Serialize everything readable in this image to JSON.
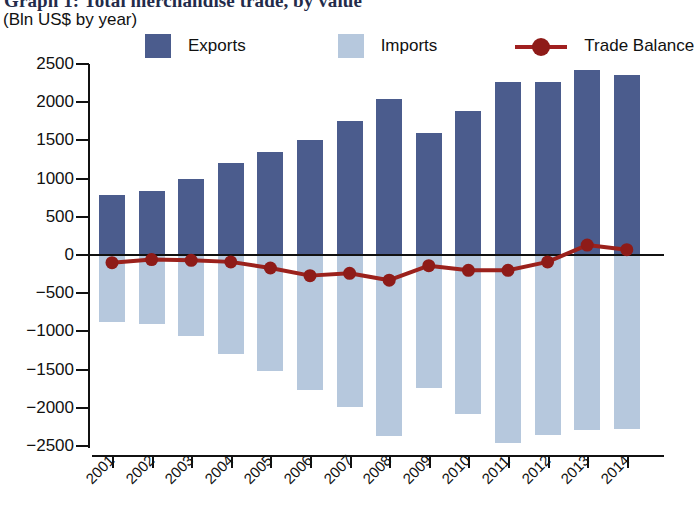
{
  "header": {
    "title": "Graph 1: Total merchandise trade, by value",
    "subtitle": "(Bln US$ by year)"
  },
  "legend": {
    "items": [
      {
        "label": "Exports",
        "color": "#4b5c8d",
        "marker": "square"
      },
      {
        "label": "Imports",
        "color": "#b6c8dd",
        "marker": "square"
      },
      {
        "label": "Trade Balance",
        "color": "#8e1b18",
        "marker": "line-dot"
      }
    ]
  },
  "chart_data": {
    "type": "bar",
    "title": "Graph 1: Total merchandise trade, by value",
    "subtitle": "(Bln US$ by year)",
    "xlabel": "",
    "ylabel": "",
    "ylim": [
      -2500,
      2500
    ],
    "ytick_labels": [
      "2500",
      "2000",
      "1500",
      "1000",
      "500",
      "0",
      "-500",
      "-1000",
      "-1500",
      "-2000",
      "-2500"
    ],
    "ytick_values": [
      2500,
      2000,
      1500,
      1000,
      500,
      0,
      -500,
      -1000,
      -1500,
      -2000,
      -2500
    ],
    "grid": false,
    "legend_position": "top",
    "categories": [
      "2001",
      "2002",
      "2003",
      "2004",
      "2005",
      "2006",
      "2007",
      "2008",
      "2009",
      "2010",
      "2011",
      "2012",
      "2013",
      "2014"
    ],
    "series": [
      {
        "name": "Exports",
        "type": "bar",
        "color": "#4b5c8d",
        "values": [
          780,
          840,
          990,
          1200,
          1350,
          1500,
          1750,
          2040,
          1600,
          1880,
          2260,
          2260,
          2420,
          2350
        ]
      },
      {
        "name": "Imports",
        "type": "bar",
        "color": "#b6c8dd",
        "values": [
          -880,
          -900,
          -1060,
          -1290,
          -1520,
          -1770,
          -1990,
          -2370,
          -1740,
          -2080,
          -2460,
          -2350,
          -2290,
          -2280
        ]
      },
      {
        "name": "Trade Balance",
        "type": "line",
        "color": "#8e1b18",
        "values": [
          -100,
          -60,
          -70,
          -90,
          -170,
          -270,
          -240,
          -330,
          -140,
          -200,
          -200,
          -90,
          130,
          70
        ]
      }
    ]
  }
}
